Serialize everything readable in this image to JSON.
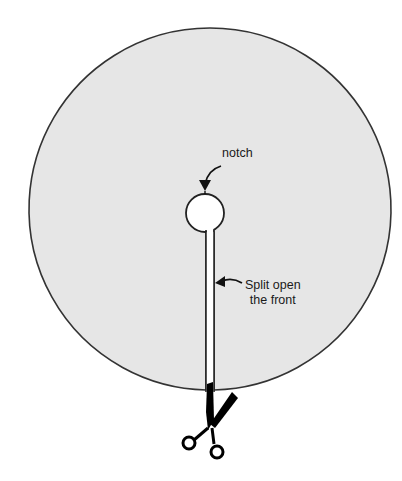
{
  "diagram": {
    "shape": "circle-skirt-pattern",
    "colors": {
      "fabric": "#e6e6e6",
      "outline": "#333333",
      "hole": "#ffffff",
      "scissors": "#000000"
    },
    "labels": {
      "notch": "notch",
      "split_line1": "Split open",
      "split_line2": "the front"
    },
    "icons": {
      "scissors": "scissors-icon",
      "notch_arrow": "curved-arrow-icon",
      "split_arrow": "curved-arrow-icon"
    }
  }
}
